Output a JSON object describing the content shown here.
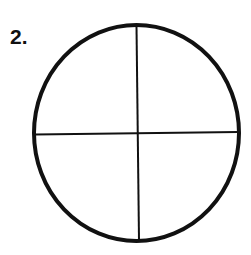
{
  "figure": {
    "number_label": "2.",
    "shape": "circle",
    "divisions": 4,
    "stroke_color": "#111111",
    "background_color": "#ffffff"
  }
}
